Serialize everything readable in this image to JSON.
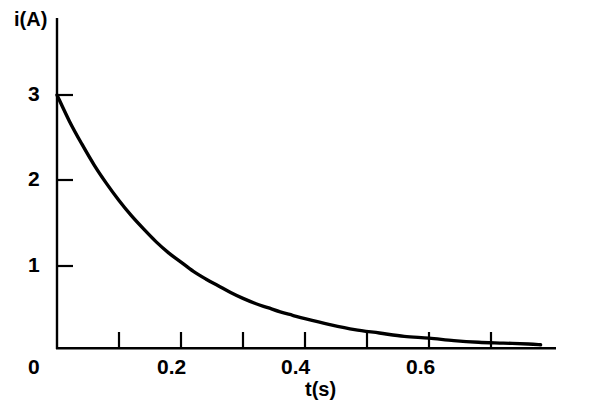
{
  "chart_data": {
    "type": "line",
    "title": "",
    "subtitle": "",
    "xlabel": "t(s)",
    "ylabel": "i(A)",
    "xlim": [
      0,
      0.78
    ],
    "ylim": [
      0,
      3.2
    ],
    "grid": false,
    "legend": null,
    "annotations": [],
    "series": [
      {
        "name": "i(t)",
        "color": "#000000",
        "equation": "i = 3 e^(-t/0.185)",
        "initial_value": 3,
        "time_constant_s": 0.185,
        "x": [
          0.0,
          0.02,
          0.04,
          0.06,
          0.08,
          0.1,
          0.12,
          0.14,
          0.16,
          0.18,
          0.2,
          0.22,
          0.24,
          0.26,
          0.28,
          0.3,
          0.32,
          0.34,
          0.36,
          0.38,
          0.4,
          0.44,
          0.48,
          0.52,
          0.56,
          0.6,
          0.64,
          0.68,
          0.72,
          0.76,
          0.78
        ],
        "y": [
          3.0,
          2.69,
          2.42,
          2.17,
          1.95,
          1.75,
          1.57,
          1.41,
          1.26,
          1.13,
          1.02,
          0.91,
          0.82,
          0.74,
          0.66,
          0.59,
          0.53,
          0.48,
          0.43,
          0.39,
          0.35,
          0.28,
          0.22,
          0.18,
          0.14,
          0.12,
          0.09,
          0.07,
          0.06,
          0.05,
          0.04
        ]
      }
    ],
    "x_ticks": [
      {
        "value": 0.0,
        "label": "0"
      },
      {
        "value": 0.1,
        "label": ""
      },
      {
        "value": 0.2,
        "label": "0.2"
      },
      {
        "value": 0.3,
        "label": ""
      },
      {
        "value": 0.4,
        "label": "0.4"
      },
      {
        "value": 0.5,
        "label": ""
      },
      {
        "value": 0.6,
        "label": "0.6"
      },
      {
        "value": 0.7,
        "label": ""
      }
    ],
    "y_ticks": [
      {
        "value": 0,
        "label": "0"
      },
      {
        "value": 1,
        "label": "1"
      },
      {
        "value": 2,
        "label": "2"
      },
      {
        "value": 3,
        "label": "3"
      }
    ]
  },
  "labels": {
    "y_axis_title": "i(A)",
    "x_axis_title": "t(s)",
    "y_tick_3": "3",
    "y_tick_2": "2",
    "y_tick_1": "1",
    "origin_tick": "0",
    "x_tick_02": "0.2",
    "x_tick_04": "0.4",
    "x_tick_06": "0.6"
  },
  "colors": {
    "background": "#ffffff",
    "axis": "#000000",
    "curve": "#000000"
  }
}
